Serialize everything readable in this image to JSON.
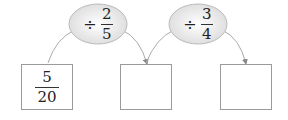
{
  "operations": [
    {
      "symbol": "÷",
      "numerator": "2",
      "denominator": "5"
    },
    {
      "symbol": "÷",
      "numerator": "3",
      "denominator": "4"
    }
  ],
  "boxes": [
    {
      "numerator": "5",
      "denominator": "20"
    },
    {
      "numerator": "",
      "denominator": ""
    },
    {
      "numerator": "",
      "denominator": ""
    }
  ]
}
